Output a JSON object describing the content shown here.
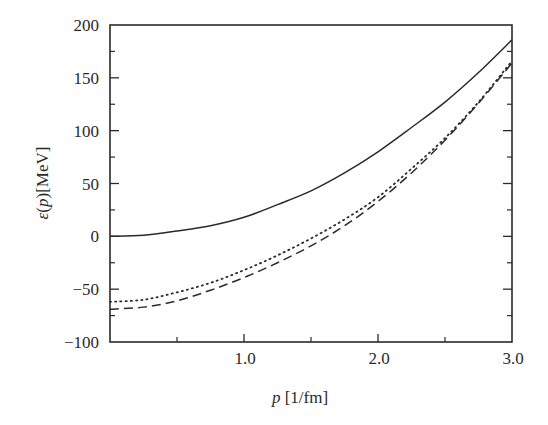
{
  "chart_data": {
    "type": "line",
    "title": "",
    "xlabel": "p [1/fm]",
    "ylabel": "ε(p)[MeV]",
    "xlim": [
      0,
      3.0
    ],
    "ylim": [
      -100,
      200
    ],
    "grid": false,
    "legend": null,
    "x_ticks": [
      {
        "value": 1.0,
        "label": "1.0"
      },
      {
        "value": 2.0,
        "label": "2.0"
      },
      {
        "value": 3.0,
        "label": "3.0"
      }
    ],
    "x_minor_ticks": [
      0.5,
      1.5,
      2.5
    ],
    "y_ticks": [
      {
        "value": 200,
        "label": "200"
      },
      {
        "value": 150,
        "label": "150"
      },
      {
        "value": 100,
        "label": "100"
      },
      {
        "value": 50,
        "label": "50"
      },
      {
        "value": 0,
        "label": "0"
      },
      {
        "value": -50,
        "label": "−50"
      },
      {
        "value": -100,
        "label": "−100"
      }
    ],
    "y_minor_ticks": [
      175,
      125,
      75,
      25,
      -25,
      -75
    ],
    "x": [
      0.0,
      0.25,
      0.5,
      0.75,
      1.0,
      1.25,
      1.5,
      1.75,
      2.0,
      2.25,
      2.5,
      2.75,
      3.0
    ],
    "series": [
      {
        "name": "solid",
        "style": "solid",
        "values": [
          0,
          1,
          5,
          10,
          18,
          30,
          43,
          60,
          80,
          103,
          127,
          155,
          186
        ]
      },
      {
        "name": "dotted",
        "style": "dotted",
        "values": [
          -62,
          -60,
          -53,
          -44,
          -32,
          -18,
          -2,
          16,
          37,
          64,
          93,
          127,
          166
        ]
      },
      {
        "name": "dashed",
        "style": "dashed",
        "values": [
          -69,
          -67,
          -61,
          -51,
          -39,
          -25,
          -9,
          10,
          33,
          60,
          91,
          126,
          164
        ]
      }
    ]
  }
}
